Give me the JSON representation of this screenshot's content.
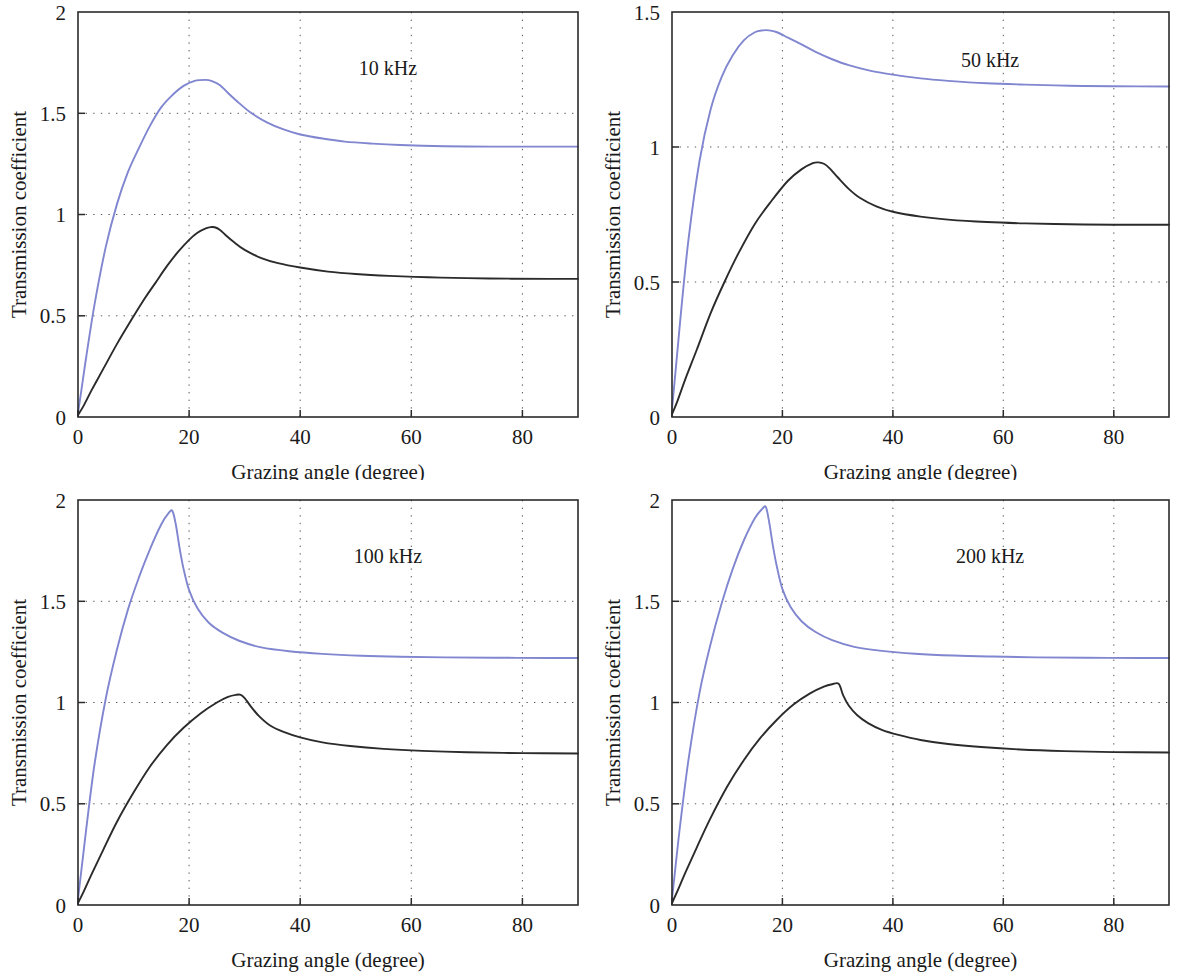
{
  "figure": {
    "kind": "four-panel-line-chart",
    "colors": {
      "series_blue": "#8086cf",
      "series_black": "#2b2b2b",
      "frame": "#2b2b2b",
      "grid": "#5a5a5a"
    }
  },
  "chart_data": [
    {
      "type": "line",
      "title": "10 kHz",
      "xlabel": "Grazing angle (degree)",
      "ylabel": "Transmission coefficient",
      "xlim": [
        0,
        90
      ],
      "ylim": [
        0,
        2
      ],
      "xticks": [
        0,
        20,
        40,
        60,
        80
      ],
      "xtick_labels": [
        "0",
        "20",
        "40",
        "60",
        "80"
      ],
      "yticks": [
        0,
        0.5,
        1,
        1.5,
        2
      ],
      "ytick_labels": [
        "0",
        "0.5",
        "1",
        "1.5",
        "2"
      ],
      "grid": true,
      "legend": "none",
      "series": [
        {
          "name": "blue",
          "color": "#8086cf",
          "x": [
            0,
            0.6,
            1.5,
            3,
            5,
            7,
            9,
            11,
            13,
            15,
            17,
            19,
            21,
            23,
            24,
            25.5,
            27,
            29,
            31,
            34,
            37,
            40,
            44,
            48,
            53,
            58,
            64,
            70,
            78,
            85,
            90
          ],
          "y": [
            0.02,
            0.13,
            0.3,
            0.56,
            0.84,
            1.05,
            1.21,
            1.33,
            1.44,
            1.53,
            1.59,
            1.635,
            1.66,
            1.665,
            1.66,
            1.64,
            1.6,
            1.55,
            1.505,
            1.455,
            1.42,
            1.395,
            1.375,
            1.36,
            1.35,
            1.343,
            1.338,
            1.336,
            1.335,
            1.335,
            1.335
          ]
        },
        {
          "name": "black",
          "color": "#2b2b2b",
          "x": [
            0,
            1,
            2.5,
            4.5,
            7,
            9.5,
            12,
            14,
            16,
            18,
            20,
            21.5,
            23,
            24,
            24.6,
            25.5,
            26.5,
            28,
            30,
            33,
            36,
            40,
            45,
            50,
            56,
            63,
            70,
            78,
            85,
            90
          ],
          "y": [
            0.01,
            0.055,
            0.135,
            0.235,
            0.36,
            0.475,
            0.585,
            0.665,
            0.745,
            0.815,
            0.875,
            0.91,
            0.932,
            0.938,
            0.937,
            0.925,
            0.9,
            0.865,
            0.825,
            0.785,
            0.76,
            0.738,
            0.718,
            0.706,
            0.697,
            0.69,
            0.686,
            0.683,
            0.682,
            0.682
          ]
        }
      ]
    },
    {
      "type": "line",
      "title": "50 kHz",
      "xlabel": "Grazing angle (degree)",
      "ylabel": "Transmission coefficient",
      "xlim": [
        0,
        90
      ],
      "ylim": [
        0,
        1.5
      ],
      "xticks": [
        0,
        20,
        40,
        60,
        80
      ],
      "xtick_labels": [
        "0",
        "20",
        "40",
        "60",
        "80"
      ],
      "yticks": [
        0,
        0.5,
        1,
        1.5
      ],
      "ytick_labels": [
        "0",
        "0.5",
        "1",
        "1.5"
      ],
      "grid": true,
      "legend": "none",
      "series": [
        {
          "name": "blue",
          "color": "#8086cf",
          "x": [
            0,
            0.6,
            1.5,
            3,
            5,
            7,
            9,
            11,
            13,
            15,
            16.5,
            17.5,
            19,
            21,
            23,
            26,
            29,
            32,
            36,
            40,
            45,
            50,
            57,
            64,
            72,
            80,
            90
          ],
          "y": [
            0.03,
            0.16,
            0.36,
            0.66,
            0.95,
            1.14,
            1.26,
            1.34,
            1.395,
            1.425,
            1.432,
            1.432,
            1.425,
            1.405,
            1.385,
            1.352,
            1.325,
            1.303,
            1.282,
            1.268,
            1.254,
            1.245,
            1.236,
            1.231,
            1.227,
            1.225,
            1.224
          ]
        },
        {
          "name": "black",
          "color": "#2b2b2b",
          "x": [
            0,
            1,
            2.5,
            4.5,
            7,
            9.5,
            12,
            15,
            18,
            21,
            23.5,
            25.5,
            26.5,
            27.5,
            28.5,
            30,
            32,
            34,
            37,
            40,
            45,
            50,
            57,
            64,
            72,
            80,
            90
          ],
          "y": [
            0.01,
            0.06,
            0.145,
            0.25,
            0.385,
            0.5,
            0.605,
            0.715,
            0.8,
            0.875,
            0.918,
            0.94,
            0.943,
            0.938,
            0.922,
            0.888,
            0.845,
            0.812,
            0.78,
            0.76,
            0.742,
            0.731,
            0.722,
            0.717,
            0.714,
            0.712,
            0.712
          ]
        }
      ]
    },
    {
      "type": "line",
      "title": "100 kHz",
      "xlabel": "Grazing angle (degree)",
      "ylabel": "Transmission coefficient",
      "xlim": [
        0,
        90
      ],
      "ylim": [
        0,
        2
      ],
      "xticks": [
        0,
        20,
        40,
        60,
        80
      ],
      "xtick_labels": [
        "0",
        "20",
        "40",
        "60",
        "80"
      ],
      "yticks": [
        0,
        0.5,
        1,
        1.5,
        2
      ],
      "ytick_labels": [
        "0",
        "0.5",
        "1",
        "1.5",
        "2"
      ],
      "grid": true,
      "legend": "none",
      "series": [
        {
          "name": "blue",
          "color": "#8086cf",
          "x": [
            0,
            0.6,
            1.5,
            3,
            5,
            7,
            9,
            11,
            13,
            15,
            16.3,
            17.0,
            17.6,
            18.3,
            19,
            20,
            21.5,
            23.5,
            26,
            29,
            33,
            38,
            44,
            51,
            58,
            66,
            75,
            85,
            90
          ],
          "y": [
            0.03,
            0.17,
            0.38,
            0.7,
            1.02,
            1.26,
            1.46,
            1.62,
            1.76,
            1.88,
            1.935,
            1.945,
            1.88,
            1.76,
            1.66,
            1.555,
            1.465,
            1.395,
            1.345,
            1.305,
            1.272,
            1.253,
            1.24,
            1.231,
            1.226,
            1.223,
            1.221,
            1.22,
            1.22
          ]
        },
        {
          "name": "black",
          "color": "#2b2b2b",
          "x": [
            0,
            1,
            2.5,
            4.5,
            7,
            10,
            13,
            16,
            19,
            22,
            25,
            27,
            28.5,
            29.3,
            30,
            31,
            32.5,
            34.5,
            37,
            40,
            44,
            49,
            55,
            62,
            70,
            80,
            90
          ],
          "y": [
            0.01,
            0.065,
            0.155,
            0.27,
            0.41,
            0.555,
            0.685,
            0.79,
            0.875,
            0.945,
            1.0,
            1.028,
            1.038,
            1.038,
            1.022,
            0.985,
            0.935,
            0.888,
            0.855,
            0.828,
            0.803,
            0.785,
            0.771,
            0.761,
            0.754,
            0.75,
            0.748
          ]
        }
      ]
    },
    {
      "type": "line",
      "title": "200 kHz",
      "xlabel": "Grazing angle (degree)",
      "ylabel": "Transmission coefficient",
      "xlim": [
        0,
        90
      ],
      "ylim": [
        0,
        2
      ],
      "xticks": [
        0,
        20,
        40,
        60,
        80
      ],
      "xtick_labels": [
        "0",
        "20",
        "40",
        "60",
        "80"
      ],
      "yticks": [
        0,
        0.5,
        1,
        1.5,
        2
      ],
      "ytick_labels": [
        "0",
        "0.5",
        "1",
        "1.5",
        "2"
      ],
      "grid": true,
      "legend": "none",
      "series": [
        {
          "name": "blue",
          "color": "#8086cf",
          "x": [
            0,
            0.6,
            1.5,
            3,
            5,
            7,
            9,
            11,
            13,
            15,
            16.3,
            17.0,
            17.6,
            18.3,
            19,
            20,
            21.5,
            23.5,
            26,
            29,
            33,
            38,
            44,
            51,
            58,
            66,
            75,
            85,
            90
          ],
          "y": [
            0.03,
            0.18,
            0.4,
            0.72,
            1.05,
            1.29,
            1.49,
            1.66,
            1.8,
            1.91,
            1.955,
            1.965,
            1.89,
            1.77,
            1.67,
            1.56,
            1.47,
            1.4,
            1.348,
            1.308,
            1.275,
            1.255,
            1.241,
            1.232,
            1.227,
            1.223,
            1.221,
            1.22,
            1.22
          ]
        },
        {
          "name": "black",
          "color": "#2b2b2b",
          "x": [
            0,
            1,
            2.5,
            4.5,
            7,
            10,
            13,
            16,
            19,
            22,
            25,
            27.5,
            29,
            30.2,
            31,
            32,
            33.5,
            35.5,
            38,
            41,
            45,
            50,
            56,
            63,
            71,
            80,
            90
          ],
          "y": [
            0.01,
            0.07,
            0.165,
            0.285,
            0.43,
            0.585,
            0.715,
            0.825,
            0.915,
            0.99,
            1.045,
            1.078,
            1.09,
            1.092,
            1.035,
            0.985,
            0.938,
            0.898,
            0.865,
            0.84,
            0.815,
            0.795,
            0.78,
            0.768,
            0.76,
            0.755,
            0.753
          ]
        }
      ]
    }
  ]
}
